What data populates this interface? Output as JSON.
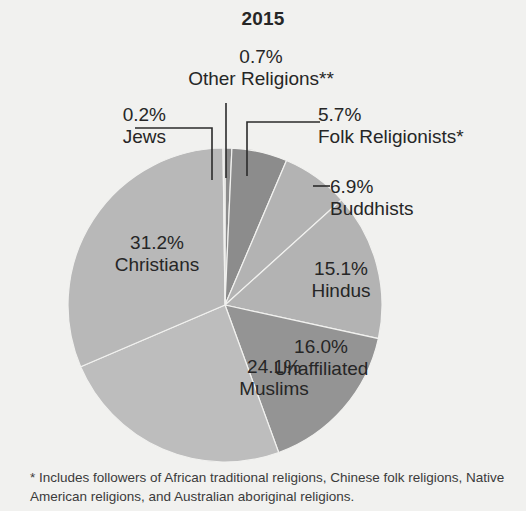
{
  "title": "2015",
  "background_color": "#f1f1ef",
  "footnote": "* Includes followers of African traditional religions, Chinese folk religions, Native American religions, and Australian aboriginal religions.",
  "labels": {
    "other": {
      "pct": "0.7%",
      "name": "Other Religions**"
    },
    "jews": {
      "pct": "0.2%",
      "name": "Jews"
    },
    "folk": {
      "pct": "5.7%",
      "name": "Folk Religionists*"
    },
    "budd": {
      "pct": "6.9%",
      "name": "Buddhists"
    },
    "hindu": {
      "pct": "15.1%",
      "name": "Hindus"
    },
    "unaff": {
      "pct": "16.0%",
      "name": "Unaffiliated"
    },
    "musl": {
      "pct": "24.1%",
      "name": "Muslims"
    },
    "chris": {
      "pct": "31.2%",
      "name": "Christians"
    }
  },
  "chart_data": {
    "type": "pie",
    "title": "2015",
    "xlabel": "",
    "ylabel": "",
    "units": "percent of world population",
    "center": [
      225,
      305
    ],
    "radius": 157,
    "start_angle_deg": -90,
    "direction": "clockwise",
    "categories": [
      "Other Religions**",
      "Folk Religionists*",
      "Buddhists",
      "Hindus",
      "Unaffiliated",
      "Muslims",
      "Christians",
      "Jews"
    ],
    "values": [
      0.7,
      5.7,
      6.9,
      15.1,
      16.0,
      24.1,
      31.2,
      0.2
    ],
    "slice_colors": [
      "#8c8c8c",
      "#8c8c8c",
      "#b3b3b3",
      "#b3b3b3",
      "#949494",
      "#bdbdbd",
      "#b8b8b8",
      "#d5d5d5"
    ],
    "annotations": [
      "* Includes followers of African traditional religions, Chinese folk religions, Native American religions, and Australian aboriginal religions."
    ],
    "legend": "none",
    "grid": false
  }
}
